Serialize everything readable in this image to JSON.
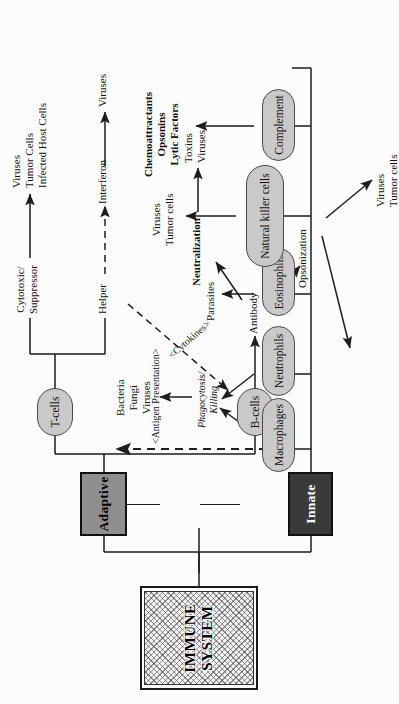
{
  "diagram": {
    "title": "IMMUNE SYSTEM",
    "orientation": "rotated-90-ccw",
    "root": {
      "label": "IMMUNE SYSTEM"
    },
    "branches": [
      {
        "id": "innate",
        "label": "Innate",
        "style": "dark-box"
      },
      {
        "id": "adaptive",
        "label": "Adaptive",
        "style": "gray-box"
      }
    ],
    "innate_cells": [
      {
        "id": "macrophages",
        "label": "Macrophages",
        "process": "Phagocytosis/\nKilling",
        "targets": "Bacteria\nFungi\nViruses"
      },
      {
        "id": "neutrophils",
        "label": "Neutrophils",
        "process": "Phagocytosis/\nKilling",
        "targets": "Bacteria\nFungi\nViruses"
      },
      {
        "id": "eosinophils",
        "label": "Eosinophils",
        "process": "",
        "targets": "Parasites"
      },
      {
        "id": "nk",
        "label": "Natural killer cells",
        "process": "",
        "targets": "Viruses\nTumor cells"
      },
      {
        "id": "complement",
        "label": "Complement",
        "process": "",
        "targets": "Chemoattractants\nOpsonins\nLytic Factors"
      }
    ],
    "adaptive_cells": [
      {
        "id": "tcells",
        "label": "T-cells"
      },
      {
        "id": "bcells",
        "label": "B-cells"
      }
    ],
    "tcell_subsets": [
      {
        "id": "cytotoxic",
        "label": "Cytotoxic/\nSuppressor",
        "targets": "Viruses\nTumor Cells\nInfected Host Cells"
      },
      {
        "id": "helper",
        "label": "Helper",
        "mediator": "Interferon",
        "targets": "Viruses"
      }
    ],
    "bcell_products": [
      {
        "id": "antibody",
        "label": "Antibody"
      },
      {
        "id": "neutralization",
        "label": "Neutralization",
        "targets": "Toxins\nViruses"
      },
      {
        "id": "opsonization",
        "label": "Opsonization",
        "targets_a": "Bacteria\nFungi\nViruses",
        "targets_b": "Viruses\nTumor cells"
      }
    ],
    "signals": [
      {
        "id": "antigen-presentation",
        "label": "<Antigen Presentation>",
        "style": "dashed"
      },
      {
        "id": "cytokines",
        "label": "<Cytokines>",
        "style": "dashed"
      }
    ],
    "text": {
      "phagocytosis_killing": "Phagocytosis/\nKilling",
      "bacteria_fungi_viruses": "Bacteria\nFungi\nViruses",
      "parasites": "Parasites",
      "viruses_tumorcells": "Viruses\nTumor cells",
      "chemo_ops_lytic": "Chemoattractants\nOpsonins\nLytic Factors",
      "cytotoxic_suppressor": "Cytotoxic/\nSuppressor",
      "viruses_tumorcells_infected": "Viruses\nTumor Cells\nInfected Host Cells",
      "helper": "Helper",
      "interferon": "Interferon",
      "viruses": "Viruses",
      "antibody": "Antibody",
      "neutralization": "Neutralization",
      "toxins_viruses": "Toxins\nViruses",
      "opsonization": "Opsonization",
      "antigen_presentation": "<Antigen Presentation>",
      "cytokines": "<Cytokines>"
    },
    "colors": {
      "ink": "#1d1d1d",
      "innate_fill": "#3a3a3a",
      "adaptive_fill": "#8f8f8f",
      "pill_fill": "#c9c9c9",
      "page": "#fcfcfc"
    }
  }
}
